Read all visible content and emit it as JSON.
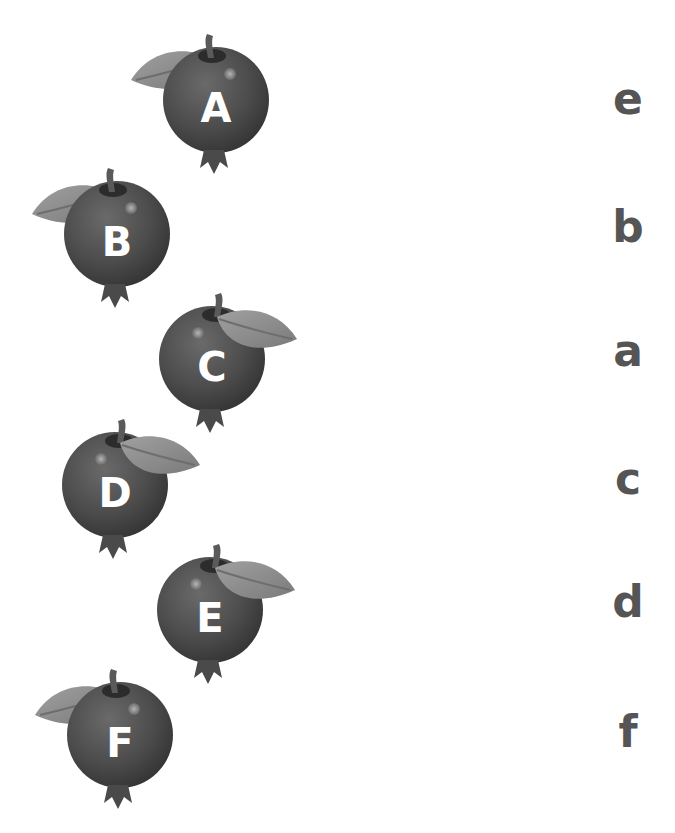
{
  "worksheet": {
    "fruits": [
      {
        "letter": "A",
        "leaf_side": "left",
        "x": 116,
        "y": 28
      },
      {
        "letter": "B",
        "leaf_side": "left",
        "x": 17,
        "y": 162
      },
      {
        "letter": "C",
        "leaf_side": "right",
        "x": 112,
        "y": 287
      },
      {
        "letter": "D",
        "leaf_side": "right",
        "x": 15,
        "y": 413
      },
      {
        "letter": "E",
        "leaf_side": "right",
        "x": 110,
        "y": 538
      },
      {
        "letter": "F",
        "leaf_side": "left",
        "x": 20,
        "y": 663
      }
    ],
    "lowercase_letters": [
      {
        "letter": "e",
        "y": 74
      },
      {
        "letter": "b",
        "y": 202
      },
      {
        "letter": "a",
        "y": 326
      },
      {
        "letter": "c",
        "y": 454
      },
      {
        "letter": "d",
        "y": 577
      },
      {
        "letter": "f",
        "y": 707
      }
    ]
  },
  "colors": {
    "fruit_body": "#4a4a4a",
    "fruit_highlight": "#8a8a8a",
    "leaf": "#8c8c8c",
    "stem": "#5a5a5a",
    "uppercase_text": "#ffffff",
    "lowercase_text": "#555555",
    "background": "#ffffff"
  }
}
